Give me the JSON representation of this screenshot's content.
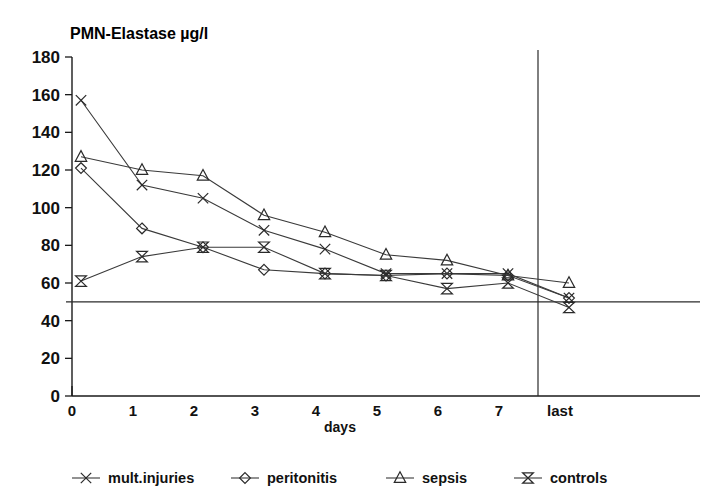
{
  "chart_data": {
    "type": "line",
    "title": "PMN-Elastase µg/l",
    "xlabel": "days",
    "ylabel": "",
    "ylim": [
      0,
      180
    ],
    "ytick_step": 20,
    "yticks": [
      0,
      20,
      40,
      60,
      80,
      100,
      120,
      140,
      160,
      180
    ],
    "ytick_labels": [
      "0",
      "20",
      "40",
      "60",
      "80",
      "100",
      "120",
      "140",
      "160",
      "180"
    ],
    "x": [
      0,
      1,
      2,
      3,
      4,
      5,
      6,
      7,
      8
    ],
    "xtick_labels": [
      "0",
      "1",
      "2",
      "3",
      "4",
      "5",
      "6",
      "7",
      "last"
    ],
    "grid": false,
    "legend_position": "bottom",
    "reference_line_y": 50,
    "separator_after_x": 7,
    "series": [
      {
        "name": "mult.injuries",
        "marker": "cross",
        "values": [
          157,
          112,
          105,
          88,
          78,
          65,
          65,
          65,
          52
        ]
      },
      {
        "name": "peritonitis",
        "marker": "diamond",
        "values": [
          121,
          89,
          79,
          67,
          65,
          64,
          65,
          64,
          52
        ]
      },
      {
        "name": "sepsis",
        "marker": "triangle",
        "values": [
          127,
          120,
          117,
          96,
          87,
          75,
          72,
          64,
          60
        ]
      },
      {
        "name": "controls",
        "marker": "bowtie",
        "values": [
          61,
          74,
          79,
          79,
          65,
          64,
          57,
          60,
          47
        ]
      }
    ]
  }
}
